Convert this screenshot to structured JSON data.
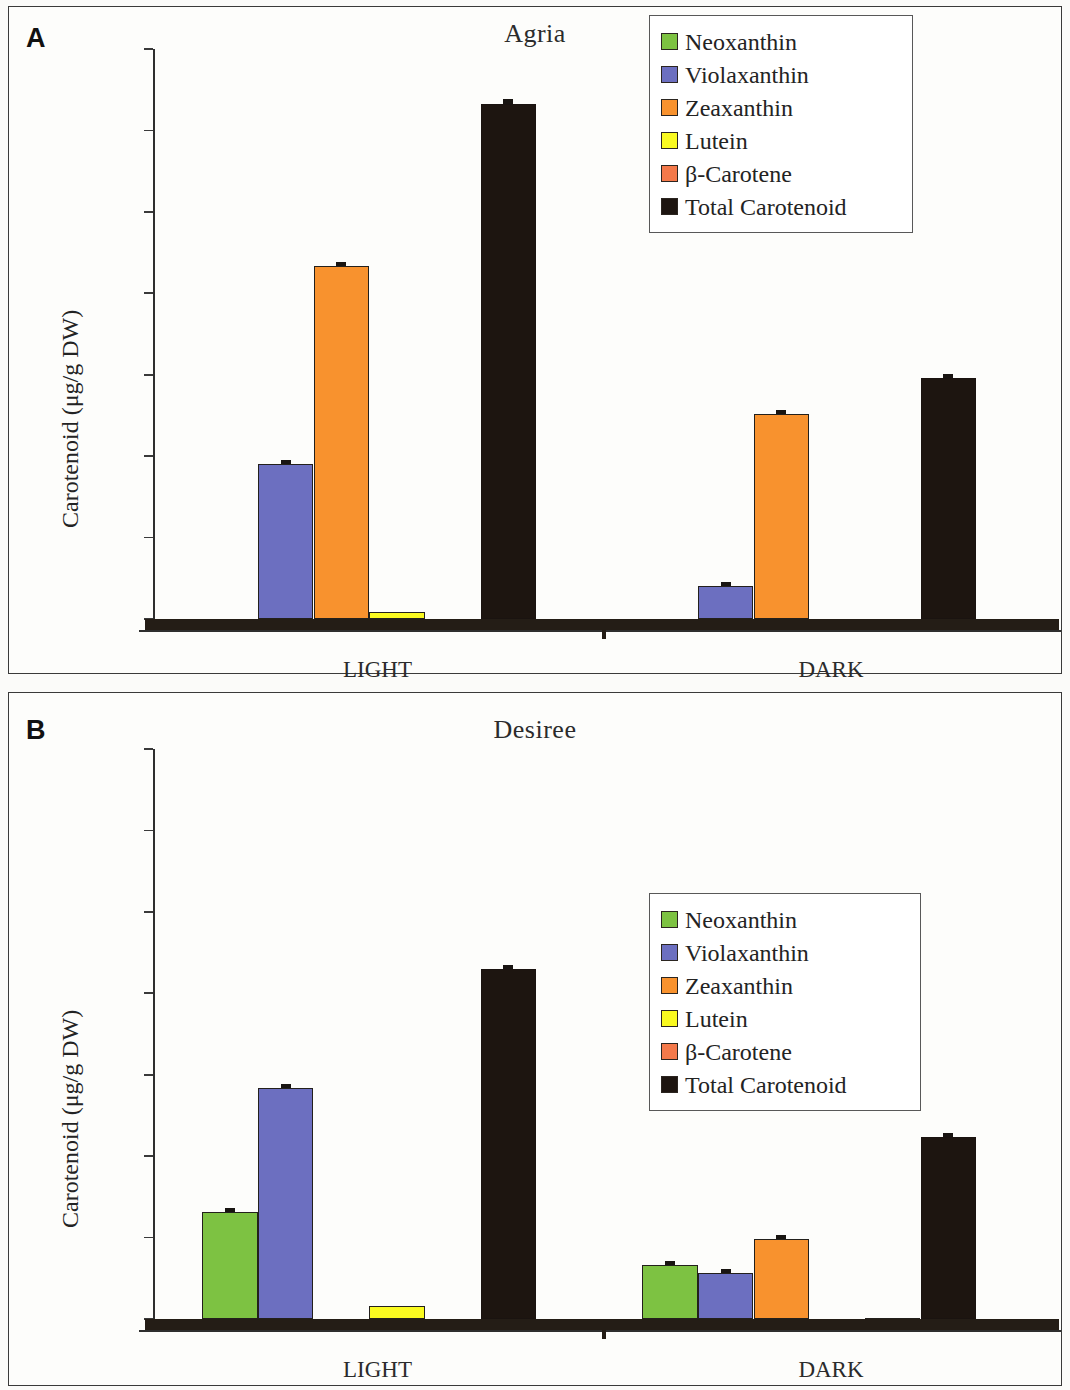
{
  "figure": {
    "background": "#fbfbf9",
    "panels": [
      {
        "letter": "A",
        "title": "Agria"
      },
      {
        "letter": "B",
        "title": "Desiree"
      }
    ]
  },
  "series_colors": {
    "neoxanthin": "#7DC242",
    "violaxanthin": "#6C6FC0",
    "zeaxanthin": "#F8922E",
    "lutein": "#FAFA20",
    "beta_carotene": "#F4794A",
    "total_carotenoid": "#1D1510"
  },
  "legend": {
    "items": [
      {
        "label": "Neoxanthin",
        "color": "#7DC242"
      },
      {
        "label": "Violaxanthin",
        "color": "#6C6FC0"
      },
      {
        "label": "Zeaxanthin",
        "color": "#F8922E"
      },
      {
        "label": "Lutein",
        "color": "#FAFA20"
      },
      {
        "label": "β-Carotene",
        "color": "#F4794A"
      },
      {
        "label": "Total Carotenoid",
        "color": "#1D1510"
      }
    ]
  },
  "chart_data": [
    {
      "type": "bar",
      "panel": "A",
      "title": "Agria",
      "xlabel": "Treatment",
      "ylabel": "Carotenoid (μg/g DW)",
      "categories": [
        "LIGHT",
        "DARK"
      ],
      "ylim": [
        0,
        350
      ],
      "yticks": [
        0,
        50,
        100,
        150,
        200,
        250,
        300,
        350
      ],
      "ytick_labels": [
        "0",
        "50",
        "100",
        "150",
        "200",
        "250",
        "300",
        "350"
      ],
      "grid": false,
      "legend_position": "top-right",
      "series": [
        {
          "name": "Neoxanthin",
          "color": "#7DC242",
          "values": [
            0,
            0
          ],
          "errors": [
            0,
            0
          ]
        },
        {
          "name": "Violaxanthin",
          "color": "#6C6FC0",
          "values": [
            95,
            20
          ],
          "errors": [
            1.5,
            1.2
          ]
        },
        {
          "name": "Zeaxanthin",
          "color": "#F8922E",
          "values": [
            217,
            126
          ],
          "errors": [
            2,
            1.5
          ]
        },
        {
          "name": "Lutein",
          "color": "#FAFA20",
          "values": [
            4,
            0
          ],
          "errors": [
            0.5,
            0
          ]
        },
        {
          "name": "β-Carotene",
          "color": "#F4794A",
          "values": [
            0,
            0
          ],
          "errors": [
            0,
            0
          ]
        },
        {
          "name": "Total Carotenoid",
          "color": "#1D1510",
          "values": [
            316,
            148
          ],
          "errors": [
            3,
            2
          ]
        }
      ]
    },
    {
      "type": "bar",
      "panel": "B",
      "title": "Desiree",
      "xlabel": "Treatment",
      "ylabel": "Carotenoid (μg/g DW)",
      "categories": [
        "LIGHT",
        "DARK"
      ],
      "ylim": [
        0,
        350
      ],
      "yticks": [
        0,
        50,
        100,
        150,
        200,
        250,
        300,
        350
      ],
      "ytick_labels": [
        "0",
        "50",
        "100",
        "150",
        "200",
        "250",
        "300",
        "350"
      ],
      "grid": false,
      "legend_position": "center-right",
      "series": [
        {
          "name": "Neoxanthin",
          "color": "#7DC242",
          "values": [
            66,
            33
          ],
          "errors": [
            1.2,
            1.2
          ]
        },
        {
          "name": "Violaxanthin",
          "color": "#6C6FC0",
          "values": [
            142,
            28
          ],
          "errors": [
            1.5,
            1.0
          ]
        },
        {
          "name": "Zeaxanthin",
          "color": "#F8922E",
          "values": [
            0,
            49
          ],
          "errors": [
            0,
            1.2
          ]
        },
        {
          "name": "Lutein",
          "color": "#FAFA20",
          "values": [
            8,
            0
          ],
          "errors": [
            0.6,
            0
          ]
        },
        {
          "name": "β-Carotene",
          "color": "#F4794A",
          "values": [
            0,
            0.8
          ],
          "errors": [
            0,
            0
          ]
        },
        {
          "name": "Total Carotenoid",
          "color": "#1D1510",
          "values": [
            215,
            112
          ],
          "errors": [
            1.5,
            1.5
          ]
        }
      ]
    }
  ]
}
